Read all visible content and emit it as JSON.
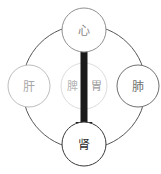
{
  "diagram": {
    "type": "tcm-organ-relationship-diagram",
    "background_color": "#ffffff",
    "width": 161,
    "height": 174,
    "ring": {
      "name": "outer-connecting-ring",
      "center_x": 84,
      "center_y": 87,
      "radius_x": 62,
      "radius_y": 62,
      "stroke_color": "#555555",
      "stroke_width": 1
    },
    "arrow": {
      "name": "heart-to-kidney-arrow",
      "label": "",
      "from": "heart",
      "to": "kidney",
      "through": "spleen-stomach",
      "x": 84,
      "y_start": 50,
      "y_end": 142,
      "shaft_width": 7,
      "head_width": 17,
      "head_height": 20,
      "color": "#1a1a1a"
    },
    "nodes": [
      {
        "id": "heart",
        "label": "心",
        "position": "top",
        "cx": 84,
        "cy": 30,
        "r": 22,
        "stroke_color": "#909090",
        "fill_color": "#ffffff",
        "text_color": "#8a8a8a"
      },
      {
        "id": "liver",
        "label": "肝",
        "position": "left",
        "cx": 29,
        "cy": 86,
        "r": 21,
        "stroke_color": "#bdbdbd",
        "fill_color": "#ffffff",
        "text_color": "#a8a8a8"
      },
      {
        "id": "spleen-stomach",
        "label": "脾胃",
        "label_left": "脾",
        "label_right": "胃",
        "position": "center",
        "cx": 84,
        "cy": 86,
        "r": 23,
        "stroke_color": "#dcdcdc",
        "fill_color": "#ffffff",
        "text_color": "#b4b4b4"
      },
      {
        "id": "lung",
        "label": "肺",
        "position": "right",
        "cx": 138,
        "cy": 86,
        "r": 21,
        "stroke_color": "#707070",
        "fill_color": "#ffffff",
        "text_color": "#6e6e6e"
      },
      {
        "id": "kidney",
        "label": "肾",
        "position": "bottom",
        "cx": 84,
        "cy": 144,
        "r": 22,
        "stroke_color": "#3a3a3a",
        "fill_color": "#ffffff",
        "text_color": "#2b2b2b"
      }
    ]
  }
}
